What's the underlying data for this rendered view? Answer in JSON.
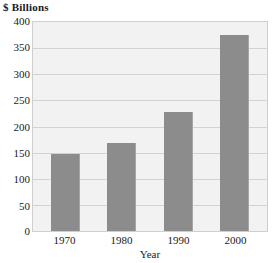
{
  "chart_data": {
    "type": "bar",
    "title": "$ Billions",
    "xlabel": "Year",
    "ylabel": "",
    "categories": [
      "1970",
      "1980",
      "1990",
      "2000"
    ],
    "values": [
      147,
      168,
      228,
      375
    ],
    "series": [
      {
        "name": "$ Billions",
        "values": [
          147,
          168,
          228,
          375
        ]
      }
    ],
    "ylim": [
      0,
      400
    ],
    "ytick_step": 50,
    "yticks": [
      "400",
      "350",
      "300",
      "250",
      "200",
      "150",
      "100",
      "50",
      "0"
    ],
    "ytick_values": [
      400,
      350,
      300,
      250,
      200,
      150,
      100,
      50,
      0
    ],
    "grid": "horizontal",
    "legend": "none",
    "colors": {
      "bar": "#8c8c8c",
      "bar_edge": "#a6a6a6",
      "plot_background": "#f2f2f2",
      "gridline": "#d2d2d2",
      "frame": "#cfcfcf",
      "text": "#1a1a1a",
      "page_background": "#ffffff"
    }
  }
}
